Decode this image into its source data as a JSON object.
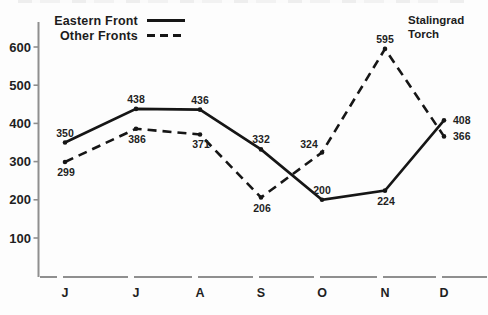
{
  "figure": {
    "background": "#fdfdfd",
    "ink_color": "#161616",
    "axis_color": "#8f8f8f",
    "label_color": "#1f1f1f"
  },
  "legend": {
    "items": [
      {
        "label": "Eastern Front",
        "line_style": "solid"
      },
      {
        "label": "Other Fronts",
        "line_style": "dashed"
      }
    ]
  },
  "annotation": {
    "line1": "Stalingrad",
    "line2": "Torch"
  },
  "chart_data": {
    "type": "line",
    "x_categories": [
      "J",
      "J",
      "A",
      "S",
      "O",
      "N",
      "D"
    ],
    "y_ticks": [
      100,
      200,
      300,
      400,
      500,
      600
    ],
    "ylim": [
      0,
      650
    ],
    "grid": false,
    "legend_position": "top-left",
    "series": [
      {
        "name": "Eastern Front",
        "line_style": "solid",
        "values": [
          350,
          438,
          436,
          332,
          200,
          224,
          408
        ],
        "label_pos": [
          "above",
          "above",
          "above",
          "above",
          "above",
          "below",
          "right"
        ]
      },
      {
        "name": "Other Fronts",
        "line_style": "dashed",
        "values": [
          299,
          386,
          371,
          206,
          324,
          595,
          366
        ],
        "label_pos": [
          "below",
          "below",
          "below",
          "below",
          "above-left",
          "above",
          "right"
        ]
      }
    ],
    "annotations": [
      {
        "text": "Stalingrad Torch",
        "x_category": "N",
        "position": "top"
      }
    ]
  }
}
